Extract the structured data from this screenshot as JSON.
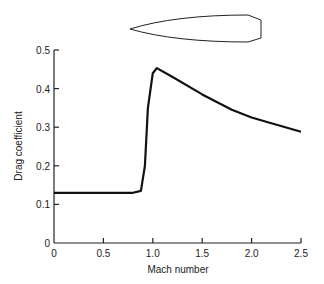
{
  "chart_data": {
    "type": "line",
    "title": "",
    "xlabel": "Mach number",
    "ylabel": "Drag coefficient",
    "xlim": [
      0,
      2.5
    ],
    "ylim": [
      0,
      0.5
    ],
    "xticks": [
      "0",
      "0.5",
      "1.0",
      "1.5",
      "2.0",
      "2.5"
    ],
    "yticks": [
      "0",
      "0.1",
      "0.2",
      "0.3",
      "0.4",
      "0.5"
    ],
    "grid": false,
    "series": [
      {
        "name": "Drag coefficient",
        "x": [
          0,
          0.5,
          0.8,
          0.88,
          0.92,
          0.95,
          1.0,
          1.04,
          1.2,
          1.5,
          1.8,
          2.0,
          2.2,
          2.5
        ],
        "y": [
          0.13,
          0.13,
          0.13,
          0.135,
          0.2,
          0.35,
          0.44,
          0.453,
          0.43,
          0.385,
          0.345,
          0.325,
          0.31,
          0.288
        ]
      }
    ],
    "annotations": [
      "projectile outline (bullet silhouette) above plot"
    ]
  }
}
